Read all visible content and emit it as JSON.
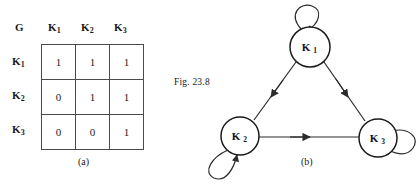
{
  "figure": {
    "label": "Fig. 23.8"
  },
  "panel_a": {
    "caption": "(a)",
    "corner_label": "G",
    "column_headers": [
      {
        "base": "K",
        "sub": "1"
      },
      {
        "base": "K",
        "sub": "2"
      },
      {
        "base": "K",
        "sub": "3"
      }
    ],
    "row_headers": [
      {
        "base": "K",
        "sub": "1"
      },
      {
        "base": "K",
        "sub": "2"
      },
      {
        "base": "K",
        "sub": "3"
      }
    ],
    "matrix": [
      [
        "1",
        "1",
        "1"
      ],
      [
        "0",
        "1",
        "1"
      ],
      [
        "0",
        "0",
        "1"
      ]
    ]
  },
  "panel_b": {
    "caption": "(b)",
    "nodes": [
      {
        "id": "K1",
        "base": "K",
        "sub": "1",
        "cx": 140,
        "cy": 47,
        "r": 20
      },
      {
        "id": "K2",
        "base": "K",
        "sub": "2",
        "cx": 70,
        "cy": 136,
        "r": 19
      },
      {
        "id": "K3",
        "base": "K",
        "sub": "3",
        "cx": 208,
        "cy": 138,
        "r": 19
      }
    ],
    "edges": [
      {
        "from": "K1",
        "to": "K2",
        "kind": "directed"
      },
      {
        "from": "K1",
        "to": "K3",
        "kind": "directed"
      },
      {
        "from": "K2",
        "to": "K3",
        "kind": "directed"
      },
      {
        "from": "K1",
        "to": "K1",
        "kind": "self-loop"
      },
      {
        "from": "K2",
        "to": "K2",
        "kind": "self-loop"
      },
      {
        "from": "K3",
        "to": "K3",
        "kind": "self-loop"
      }
    ]
  },
  "colors": {
    "ink": "#1a1a1a",
    "stroke": "#2b2b2b",
    "grid_line": "#4a4a4a",
    "background": "#ffffff"
  }
}
